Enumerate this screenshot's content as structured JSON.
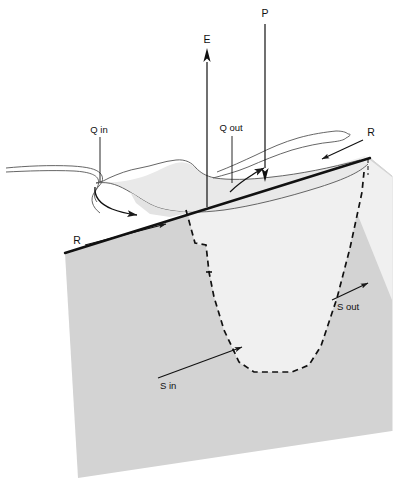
{
  "figure": {
    "caption": "",
    "background_color": "#ffffff",
    "ground_block_color": "#d3d3d3",
    "basin_interior_color": "#f0f0f0",
    "lake_surface_color": "#e9e9e9",
    "line_color": "#1a1a1a"
  },
  "labels": {
    "evaporation": "E",
    "precipitation": "P",
    "inflow": "Q in",
    "outflow": "Q out",
    "runoff_left": "R",
    "runoff_right": "R",
    "seepage_in": "S in",
    "seepage_out": "S out"
  },
  "icons": {
    "arrow_up": "arrow-up-icon",
    "arrow_down": "arrow-down-icon",
    "arrow_flow": "arrow-flow-icon"
  }
}
